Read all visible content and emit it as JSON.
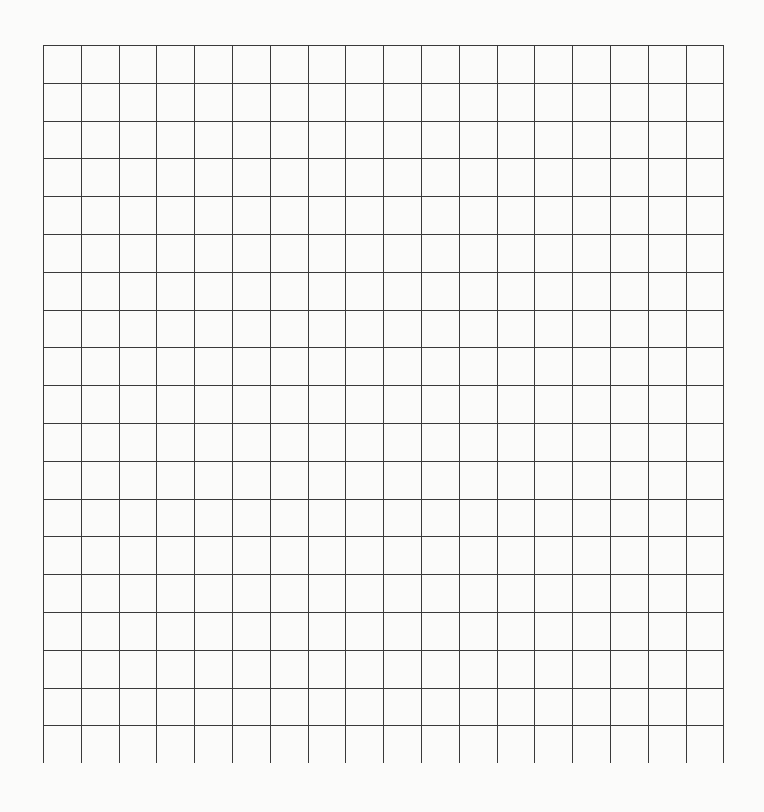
{
  "page": {
    "background": "#fbfbfa",
    "line_color": "#3a3a3a"
  },
  "grid": {
    "left": 43,
    "top": 45,
    "cell_size": 37.8,
    "columns": 18,
    "closed_rows": 18,
    "open_bottom_extension": 37.8
  }
}
